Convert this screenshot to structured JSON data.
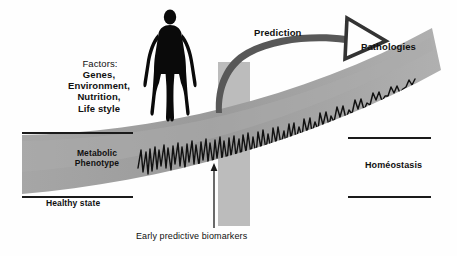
{
  "figure": {
    "title_absent": true,
    "background_color": "#fefefe",
    "band_color": "#9d9d9d",
    "band_color_light": "#b4b4b4",
    "column_color": "#b9b9b9",
    "line_color": "#1a1a1a",
    "silhouette_color": "#0a0a0a",
    "arrow_color": "#555555"
  },
  "labels": {
    "factors_heading": "Factors:",
    "factors_list": "Genes,\nEnvironment,\nNutrition,\nLife style",
    "prediction": "Prediction",
    "pathologies": "Pathologies",
    "metabolic_phenotype": "Metabolic\nPhenotype",
    "healthy_state": "Healthy state",
    "homeostasis": "Homéostasis",
    "early_biomarkers": "Early predictive biomarkers"
  },
  "icons": {
    "human_figure": "human-silhouette-icon",
    "prediction_arrow": "curved-arrow-icon",
    "pointer": "pointer-line-icon"
  },
  "axes": {
    "left_upper_line": {
      "x1": 22,
      "y1": 133,
      "x2": 133,
      "y2": 133
    },
    "left_lower_line": {
      "x1": 22,
      "y1": 197,
      "x2": 133,
      "y2": 197
    },
    "right_upper_line": {
      "x1": 348,
      "y1": 138,
      "x2": 431,
      "y2": 138
    },
    "right_lower_line": {
      "x1": 348,
      "y1": 197,
      "x2": 431,
      "y2": 197
    }
  }
}
